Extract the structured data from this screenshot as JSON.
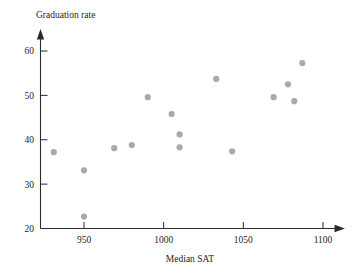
{
  "chart_data": {
    "type": "scatter",
    "title": "",
    "xlabel": "Median SAT",
    "ylabel": "Graduation rate",
    "xlim": [
      920,
      1110
    ],
    "ylim": [
      20,
      63
    ],
    "grid": false,
    "legend": "none",
    "xticks": [
      950,
      1000,
      1050,
      1100
    ],
    "xtick_labels": [
      "950",
      "1000",
      "1050",
      "1100"
    ],
    "yticks": [
      20,
      30,
      40,
      50,
      60
    ],
    "ytick_labels": [
      "20",
      "30",
      "40",
      "50",
      "60"
    ],
    "marker": {
      "shape": "circle",
      "color": "#a9a9ad",
      "size": 3.1
    },
    "axis_color": "#2b2b2b",
    "point_count": 15,
    "x": [
      931,
      950,
      950,
      969,
      980,
      990,
      1005,
      1010,
      1010,
      1033,
      1043,
      1069,
      1078,
      1082,
      1087
    ],
    "y": [
      37.2,
      33.1,
      22.7,
      38.1,
      38.8,
      49.6,
      45.8,
      41.2,
      38.3,
      53.7,
      37.4,
      49.6,
      52.5,
      48.7,
      57.3
    ],
    "points": [
      {
        "x": 931,
        "y": 37.2
      },
      {
        "x": 950,
        "y": 33.1
      },
      {
        "x": 950,
        "y": 22.7
      },
      {
        "x": 969,
        "y": 38.1
      },
      {
        "x": 980,
        "y": 38.8
      },
      {
        "x": 990,
        "y": 49.6
      },
      {
        "x": 1005,
        "y": 45.8
      },
      {
        "x": 1010,
        "y": 41.2
      },
      {
        "x": 1010,
        "y": 38.3
      },
      {
        "x": 1033,
        "y": 53.7
      },
      {
        "x": 1043,
        "y": 37.4
      },
      {
        "x": 1069,
        "y": 49.6
      },
      {
        "x": 1078,
        "y": 52.5
      },
      {
        "x": 1082,
        "y": 48.7
      },
      {
        "x": 1087,
        "y": 57.3
      }
    ]
  },
  "labels": {
    "y_axis_title": "Graduation rate",
    "x_axis_title": "Median SAT"
  }
}
